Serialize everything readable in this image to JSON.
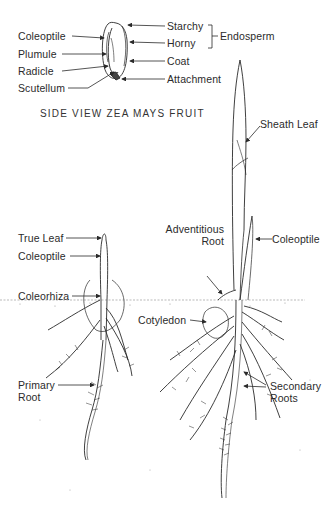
{
  "figure": {
    "kernel": {
      "caption": "SIDE VIEW ZEA MAYS FRUIT",
      "labels_left": [
        "Coleoptile",
        "Plumule",
        "Radicle",
        "Scutellum"
      ],
      "labels_right": [
        "Starchy",
        "Horny",
        "Coat",
        "Attachment"
      ],
      "bracket_label": "Endosperm"
    },
    "young_seedling": {
      "labels": {
        "true_leaf": "True Leaf",
        "coleoptile": "Coleoptile",
        "coleorhiza": "Coleorhiza",
        "primary_root_line1": "Primary",
        "primary_root_line2": "Root"
      }
    },
    "older_seedling": {
      "labels": {
        "sheath_leaf": "Sheath Leaf",
        "adventitious_line1": "Adventitious",
        "adventitious_line2": "Root",
        "coleoptile": "Coleoptile",
        "cotyledon": "Cotyledon",
        "secondary_line1": "Secondary",
        "secondary_line2": "Roots"
      }
    },
    "colors": {
      "ink": "#2a2a2a",
      "background": "#ffffff",
      "soil_dots": "#9a9a9a"
    }
  }
}
